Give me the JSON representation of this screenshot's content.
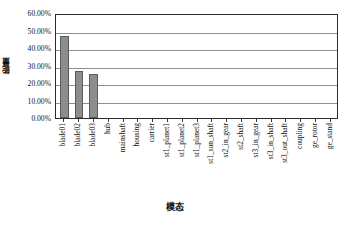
{
  "chart_data": {
    "type": "bar",
    "title": "",
    "xlabel": "模态",
    "ylabel": "能量",
    "ylim": [
      0,
      0.6
    ],
    "ytick_labels": [
      "60.00%",
      "50.00%",
      "40.00%",
      "30.00%",
      "20.00%",
      "10.00%",
      "0.00%"
    ],
    "ytick_values": [
      0.6,
      0.5,
      0.4,
      0.3,
      0.2,
      0.1,
      0.0
    ],
    "grid": "horizontal",
    "legend": "none",
    "series_name": "",
    "bar_color": "#8d8d8d",
    "bar_edge_color": "#5c5c5c",
    "axis_color": "#2b2b2b",
    "gridline_color": "#8f8f8f",
    "categories": [
      "blade01",
      "blade02",
      "blade03",
      "hub",
      "mainshaft",
      "housing",
      "carrier",
      "st1_planet1",
      "st1_planet2",
      "st1_planet3",
      "st1_sun_shaft",
      "st2_in_gear",
      "st2_shaft",
      "st3_in_gear",
      "st3_in_shaft",
      "st3_out_shaft",
      "coupling",
      "ge_rotor",
      "ge_stand"
    ],
    "values": [
      0.47,
      0.27,
      0.25,
      0.0,
      0.0,
      0.0,
      0.0,
      0.0,
      0.0,
      0.0,
      0.0,
      0.0,
      0.0,
      0.0,
      0.0,
      0.0,
      0.0,
      0.0,
      0.0
    ],
    "value_labels": [
      "47.00%",
      "27.00%",
      "25.00%",
      "0.00%",
      "0.00%",
      "0.00%",
      "0.00%",
      "0.00%",
      "0.00%",
      "0.00%",
      "0.00%",
      "0.00%",
      "0.00%",
      "0.00%",
      "0.00%",
      "0.00%",
      "0.00%",
      "0.00%",
      "0.00%"
    ]
  }
}
